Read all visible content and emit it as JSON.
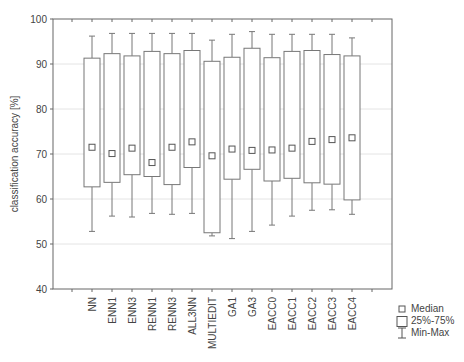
{
  "chart_data": {
    "type": "box",
    "title": "",
    "xlabel": "",
    "ylabel": "classification accuracy [%]",
    "ylim": [
      40,
      100
    ],
    "yticks": [
      40,
      50,
      60,
      70,
      80,
      90,
      100
    ],
    "grid": "horizontal",
    "categories": [
      "NN",
      "ENN1",
      "ENN3",
      "RENN1",
      "RENN3",
      "ALL3NN",
      "MULTIEDIT",
      "GA1",
      "GA3",
      "EACC0",
      "EACC1",
      "EACC2",
      "EACC3",
      "EACC4"
    ],
    "series": [
      {
        "name": "Min",
        "values": [
          52.8,
          56.2,
          56.0,
          56.8,
          56.6,
          56.8,
          51.8,
          51.2,
          52.8,
          54.2,
          56.2,
          57.5,
          57.6,
          56.6
        ]
      },
      {
        "name": "Q1 (25%)",
        "values": [
          62.7,
          63.7,
          65.4,
          65.0,
          63.2,
          67.0,
          52.5,
          64.4,
          66.6,
          64.0,
          64.6,
          63.6,
          63.3,
          59.8
        ]
      },
      {
        "name": "Median",
        "values": [
          71.5,
          70.1,
          71.3,
          68.1,
          71.5,
          72.7,
          69.6,
          71.1,
          70.8,
          70.9,
          71.3,
          72.8,
          73.2,
          73.6
        ]
      },
      {
        "name": "Q3 (75%)",
        "values": [
          91.3,
          92.3,
          91.8,
          92.8,
          92.3,
          93.0,
          90.6,
          91.5,
          93.5,
          91.4,
          92.8,
          93.0,
          92.1,
          91.8
        ]
      },
      {
        "name": "Max",
        "values": [
          96.2,
          96.8,
          96.8,
          96.8,
          96.8,
          96.8,
          95.3,
          96.6,
          97.2,
          96.6,
          96.6,
          96.6,
          96.6,
          95.8
        ]
      }
    ],
    "legend": {
      "position": "bottom-right",
      "entries": [
        "Median",
        "25%-75%",
        "Min-Max"
      ]
    }
  },
  "legend": {
    "median": "Median",
    "iqr": "25%-75%",
    "range": "Min-Max"
  }
}
